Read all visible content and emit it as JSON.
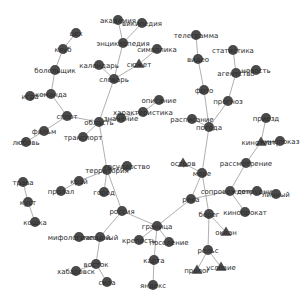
{
  "diagram": {
    "type": "network-graph",
    "nodes": [
      {
        "id": "цех",
        "x": 76,
        "y": 33,
        "shape": "circle"
      },
      {
        "id": "клуб",
        "x": 63,
        "y": 49,
        "shape": "circle"
      },
      {
        "id": "болельщик",
        "x": 55,
        "y": 70,
        "shape": "circle"
      },
      {
        "id": "команда",
        "x": 51,
        "y": 94,
        "shape": "circle"
      },
      {
        "id": "игра",
        "x": 30,
        "y": 96,
        "shape": "circle"
      },
      {
        "id": "спорт",
        "x": 67,
        "y": 116,
        "shape": "circle"
      },
      {
        "id": "фильм",
        "x": 44,
        "y": 131,
        "shape": "circle"
      },
      {
        "id": "любовь",
        "x": 26,
        "y": 142,
        "shape": "circle"
      },
      {
        "id": "транспорт",
        "x": 83,
        "y": 137,
        "shape": "circle"
      },
      {
        "id": "область",
        "x": 99,
        "y": 122,
        "shape": "circle"
      },
      {
        "id": "значение",
        "x": 121,
        "y": 118,
        "shape": "circle"
      },
      {
        "id": "характеристика",
        "x": 143,
        "y": 112,
        "shape": "circle"
      },
      {
        "id": "описание",
        "x": 159,
        "y": 100,
        "shape": "circle"
      },
      {
        "id": "словарь",
        "x": 114,
        "y": 79,
        "shape": "circle"
      },
      {
        "id": "календарь",
        "x": 99,
        "y": 65,
        "shape": "circle"
      },
      {
        "id": "энциклопедия",
        "x": 123,
        "y": 43,
        "shape": "circle"
      },
      {
        "id": "академия",
        "x": 118,
        "y": 20,
        "shape": "circle"
      },
      {
        "id": "википедия",
        "x": 142,
        "y": 23,
        "shape": "circle"
      },
      {
        "id": "символика",
        "x": 157,
        "y": 49,
        "shape": "circle"
      },
      {
        "id": "сюжет",
        "x": 139,
        "y": 64,
        "shape": "triangle"
      },
      {
        "id": "телеграмма",
        "x": 196,
        "y": 35,
        "shape": "circle"
      },
      {
        "id": "видео",
        "x": 198,
        "y": 59,
        "shape": "circle"
      },
      {
        "id": "фото",
        "x": 204,
        "y": 90,
        "shape": "circle"
      },
      {
        "id": "статистика",
        "x": 233,
        "y": 50,
        "shape": "circle"
      },
      {
        "id": "агентство",
        "x": 236,
        "y": 73,
        "shape": "circle"
      },
      {
        "id": "новость",
        "x": 256,
        "y": 70,
        "shape": "circle"
      },
      {
        "id": "прогноз",
        "x": 228,
        "y": 101,
        "shape": "circle"
      },
      {
        "id": "расписание",
        "x": 192,
        "y": 119,
        "shape": "circle"
      },
      {
        "id": "погода",
        "x": 209,
        "y": 127,
        "shape": "circle"
      },
      {
        "id": "приезд",
        "x": 266,
        "y": 118,
        "shape": "circle"
      },
      {
        "id": "кинотеатр",
        "x": 261,
        "y": 142,
        "shape": "triangle"
      },
      {
        "id": "кинопоказ",
        "x": 280,
        "y": 141,
        "shape": "circle"
      },
      {
        "id": "рассмотрение",
        "x": 246,
        "y": 163,
        "shape": "circle"
      },
      {
        "id": "остров",
        "x": 183,
        "y": 163,
        "shape": "triangle"
      },
      {
        "id": "море",
        "x": 202,
        "y": 173,
        "shape": "circle"
      },
      {
        "id": "сопровождение",
        "x": 230,
        "y": 191,
        "shape": "circle"
      },
      {
        "id": "сотрудник",
        "x": 257,
        "y": 191,
        "shape": "circle"
      },
      {
        "id": "личный",
        "x": 276,
        "y": 194,
        "shape": "circle"
      },
      {
        "id": "кинопрокат",
        "x": 245,
        "y": 212,
        "shape": "circle"
      },
      {
        "id": "река",
        "x": 191,
        "y": 199,
        "shape": "circle"
      },
      {
        "id": "берег",
        "x": 209,
        "y": 214,
        "shape": "circle"
      },
      {
        "id": "океан",
        "x": 226,
        "y": 232,
        "shape": "triangle"
      },
      {
        "id": "рельс",
        "x": 208,
        "y": 250,
        "shape": "circle"
      },
      {
        "id": "пролог",
        "x": 197,
        "y": 270,
        "shape": "triangle"
      },
      {
        "id": "условие",
        "x": 221,
        "y": 267,
        "shape": "triangle"
      },
      {
        "id": "территория",
        "x": 107,
        "y": 170,
        "shape": "circle"
      },
      {
        "id": "государство",
        "x": 127,
        "y": 166,
        "shape": "circle"
      },
      {
        "id": "край",
        "x": 79,
        "y": 181,
        "shape": "circle"
      },
      {
        "id": "пролал",
        "x": 61,
        "y": 191,
        "shape": "circle"
      },
      {
        "id": "город",
        "x": 104,
        "y": 192,
        "shape": "circle"
      },
      {
        "id": "россия",
        "x": 122,
        "y": 211,
        "shape": "circle"
      },
      {
        "id": "граница",
        "x": 157,
        "y": 226,
        "shape": "circle"
      },
      {
        "id": "крепость",
        "x": 139,
        "y": 240,
        "shape": "circle"
      },
      {
        "id": "поселение",
        "x": 169,
        "y": 242,
        "shape": "circle"
      },
      {
        "id": "карта",
        "x": 154,
        "y": 260,
        "shape": "circle"
      },
      {
        "id": "яндекс",
        "x": 153,
        "y": 285,
        "shape": "circle"
      },
      {
        "id": "трава",
        "x": 23,
        "y": 182,
        "shape": "circle"
      },
      {
        "id": "куст",
        "x": 28,
        "y": 202,
        "shape": "circle"
      },
      {
        "id": "кошка",
        "x": 35,
        "y": 222,
        "shape": "circle"
      },
      {
        "id": "мифологический",
        "x": 79,
        "y": 237,
        "shape": "circle"
      },
      {
        "id": "западный",
        "x": 100,
        "y": 237,
        "shape": "circle"
      },
      {
        "id": "восток",
        "x": 96,
        "y": 264,
        "shape": "circle"
      },
      {
        "id": "хабаровск",
        "x": 76,
        "y": 271,
        "shape": "circle"
      },
      {
        "id": "сила",
        "x": 107,
        "y": 282,
        "shape": "circle"
      }
    ],
    "edges": [
      [
        "цех",
        "клуб"
      ],
      [
        "клуб",
        "болельщик"
      ],
      [
        "болельщик",
        "команда"
      ],
      [
        "игра",
        "команда"
      ],
      [
        "команда",
        "спорт"
      ],
      [
        "спорт",
        "фильм"
      ],
      [
        "фильм",
        "любовь"
      ],
      [
        "спорт",
        "область"
      ],
      [
        "транспорт",
        "область"
      ],
      [
        "область",
        "значение"
      ],
      [
        "значение",
        "характеристика"
      ],
      [
        "характеристика",
        "описание"
      ],
      [
        "область",
        "словарь"
      ],
      [
        "словарь",
        "календарь"
      ],
      [
        "словарь",
        "энциклопедия"
      ],
      [
        "энциклопедия",
        "академия"
      ],
      [
        "энциклопедия",
        "википедия"
      ],
      [
        "словарь",
        "сюжет"
      ],
      [
        "сюжет",
        "символика"
      ],
      [
        "область",
        "территория"
      ],
      [
        "телеграмма",
        "видео"
      ],
      [
        "видео",
        "фото"
      ],
      [
        "фото",
        "погода"
      ],
      [
        "статистика",
        "агентство"
      ],
      [
        "агентство",
        "новость"
      ],
      [
        "агентство",
        "прогноз"
      ],
      [
        "прогноз",
        "погода"
      ],
      [
        "расписание",
        "погода"
      ],
      [
        "погода",
        "море"
      ],
      [
        "приезд",
        "кинотеатр"
      ],
      [
        "кинотеатр",
        "кинопоказ"
      ],
      [
        "кинотеатр",
        "рассмотрение"
      ],
      [
        "рассмотрение",
        "сопровождение"
      ],
      [
        "сопровождение",
        "сотрудник"
      ],
      [
        "сотрудник",
        "личный"
      ],
      [
        "сопровождение",
        "кинопрокат"
      ],
      [
        "сопровождение",
        "река"
      ],
      [
        "остров",
        "море"
      ],
      [
        "море",
        "река"
      ],
      [
        "море",
        "берег"
      ],
      [
        "берег",
        "океан"
      ],
      [
        "берег",
        "рельс"
      ],
      [
        "рельс",
        "пролог"
      ],
      [
        "рельс",
        "условие"
      ],
      [
        "территория",
        "государство"
      ],
      [
        "территория",
        "край"
      ],
      [
        "край",
        "пролал"
      ],
      [
        "территория",
        "город"
      ],
      [
        "территория",
        "россия"
      ],
      [
        "россия",
        "граница"
      ],
      [
        "россия",
        "западный"
      ],
      [
        "граница",
        "река"
      ],
      [
        "граница",
        "крепость"
      ],
      [
        "граница",
        "поселение"
      ],
      [
        "граница",
        "карта"
      ],
      [
        "карта",
        "яндекс"
      ],
      [
        "трава",
        "куст"
      ],
      [
        "куст",
        "кошка"
      ],
      [
        "мифологический",
        "западный"
      ],
      [
        "западный",
        "восток"
      ],
      [
        "восток",
        "хабаровск"
      ],
      [
        "восток",
        "сила"
      ]
    ]
  }
}
